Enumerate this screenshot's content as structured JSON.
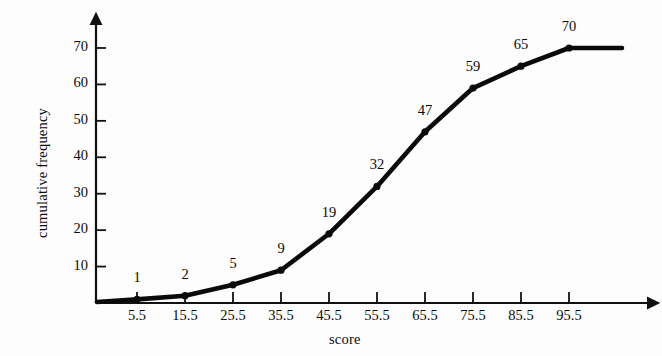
{
  "chart_data": {
    "type": "line",
    "title": "",
    "subtitle": "",
    "xlabel": "score",
    "ylabel": "cumulative frequency",
    "x": [
      5.5,
      15.5,
      25.5,
      35.5,
      45.5,
      55.5,
      65.5,
      75.5,
      85.5,
      95.5
    ],
    "values": [
      1,
      2,
      5,
      9,
      19,
      32,
      47,
      59,
      65,
      70
    ],
    "point_labels": [
      "1",
      "2",
      "5",
      "9",
      "19",
      "32",
      "47",
      "59",
      "65",
      "70"
    ],
    "xticklabels": [
      "5.5",
      "15.5",
      "25.5",
      "35.5",
      "45.5",
      "55.5",
      "65.5",
      "75.5",
      "85.5",
      "95.5"
    ],
    "yticklabels": [
      "10",
      "20",
      "30",
      "40",
      "50",
      "60",
      "70"
    ],
    "yticks": [
      10,
      20,
      30,
      40,
      50,
      60,
      70
    ],
    "xlim": [
      -4.5,
      105.5
    ],
    "ylim": [
      0,
      74
    ],
    "grid": false,
    "legend": null,
    "legend_position": "none",
    "series": [
      {
        "name": "cumulative frequency",
        "values": [
          1,
          2,
          5,
          9,
          19,
          32,
          47,
          59,
          65,
          70
        ]
      }
    ],
    "annotations": [
      "line originates at the axis origin (0, 0)",
      "line continues horizontally to the right of the final point at 70",
      "both axes terminate in arrowheads"
    ],
    "colors": {
      "line": "#0a0a0a",
      "marker": "#0a0a0a",
      "axis": "#111111",
      "background": "#fdfdfd",
      "text": "#0b0b0b"
    },
    "style": {
      "line_width": 4.6,
      "marker_size": 3.6,
      "marker": "circle"
    }
  },
  "geometry": {
    "origin_x": 96,
    "origin_y": 303,
    "x_first_tick": 137,
    "x_tick_spacing": 48,
    "y_unit_px": 3.643,
    "y_axis_top": 24,
    "x_axis_right": 648,
    "line_end_x": 622
  }
}
